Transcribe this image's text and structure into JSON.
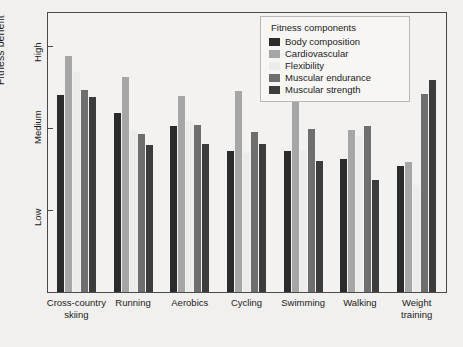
{
  "chart_data": {
    "type": "bar",
    "title": "",
    "xlabel": "",
    "ylabel": "Fitness benefit",
    "grid": false,
    "legend_position": "top-right",
    "legend_title": "Fitness components",
    "ylim": [
      0,
      3.4
    ],
    "ytick_labels": [
      "Low",
      "Medium",
      "High"
    ],
    "ytick_values": [
      1,
      2,
      3
    ],
    "categories": [
      "Cross-country\nskiing",
      "Running",
      "Aerobics",
      "Cycling",
      "Swimming",
      "Walking",
      "Weight\ntraining"
    ],
    "series": [
      {
        "name": "Body composition",
        "color": "#2b2b2b",
        "values": [
          2.4,
          2.18,
          2.02,
          1.72,
          1.72,
          1.62,
          1.54
        ]
      },
      {
        "name": "Cardiovascular",
        "color": "#a6a6a6",
        "values": [
          2.88,
          2.62,
          2.39,
          2.45,
          2.33,
          1.97,
          1.58
        ]
      },
      {
        "name": "Flexibility",
        "color": "#ececea",
        "values": [
          2.68,
          1.98,
          2.08,
          1.7,
          1.73,
          1.9,
          1.3
        ]
      },
      {
        "name": "Muscular endurance",
        "color": "#6e6e6e",
        "values": [
          2.46,
          1.92,
          2.03,
          1.95,
          1.99,
          2.02,
          2.41
        ]
      },
      {
        "name": "Muscular strength",
        "color": "#3c3c3c",
        "values": [
          2.38,
          1.79,
          1.8,
          1.8,
          1.6,
          1.36,
          2.58
        ]
      }
    ]
  },
  "legend": {
    "title": "Fitness components",
    "items": [
      {
        "label": "Body composition",
        "color": "#2b2b2b"
      },
      {
        "label": "Cardiovascular",
        "color": "#a6a6a6"
      },
      {
        "label": "Flexibility",
        "color": "#ececea"
      },
      {
        "label": "Muscular endurance",
        "color": "#6e6e6e"
      },
      {
        "label": "Muscular strength",
        "color": "#3c3c3c"
      }
    ]
  }
}
